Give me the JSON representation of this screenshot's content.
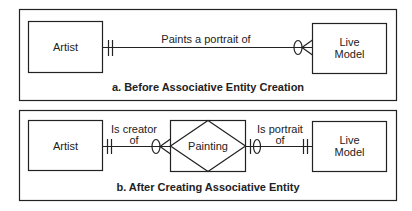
{
  "panel_a": {
    "caption": "a. Before Associative Entity Creation",
    "entity_left": "Artist",
    "entity_right_line1": "Live",
    "entity_right_line2": "Model",
    "relationship": "Paints a portrait of",
    "left_cardinality": "mandatory-one",
    "right_cardinality": "optional-many"
  },
  "panel_b": {
    "caption": "b. After Creating Associative Entity",
    "entity_left": "Artist",
    "associative_entity": "Painting",
    "entity_right_line1": "Live",
    "entity_right_line2": "Model",
    "rel_left_line1": "Is creator",
    "rel_left_line2": "of",
    "rel_right_line1": "Is portrait",
    "rel_right_line2": "of",
    "cardinalities": [
      "mandatory-one",
      "optional-many",
      "optional-one",
      "mandatory-one"
    ]
  },
  "colors": {
    "stroke": "#222222",
    "background": "#ffffff"
  }
}
